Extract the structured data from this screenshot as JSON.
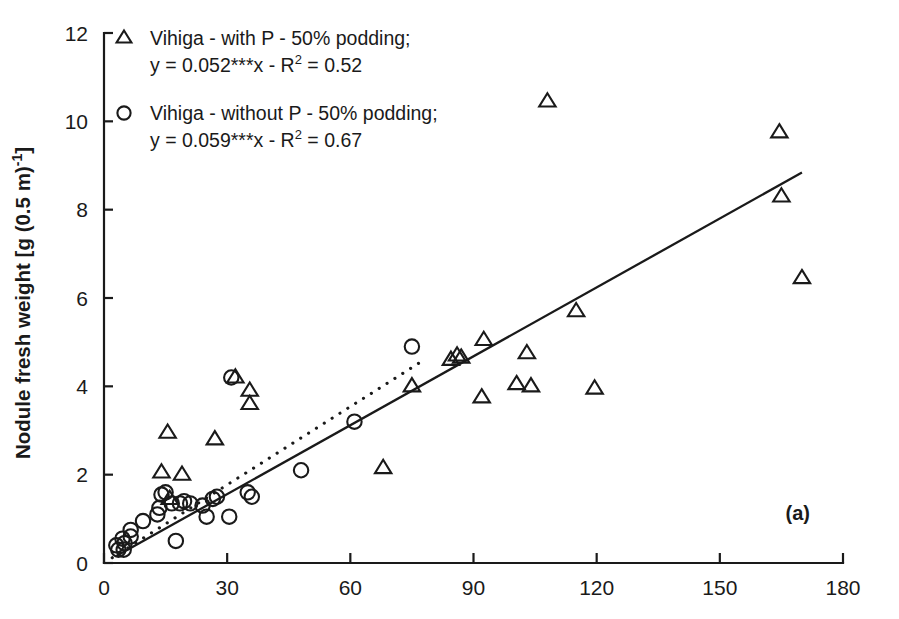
{
  "figure": {
    "panel_label": "(a)",
    "background": "#ffffff",
    "ink_color": "#1a1a1a"
  },
  "legend": {
    "entries": [
      {
        "marker": "triangle-up-open",
        "line1": "Vihiga - with P - 50% podding;",
        "eq_prefix": "y = 0.052***x - R",
        "eq_sup": "2",
        "eq_suffix": " = 0.52"
      },
      {
        "marker": "circle-open",
        "line1": "Vihiga - without P - 50% podding;",
        "eq_prefix": "y = 0.059***x - R",
        "eq_sup": "2",
        "eq_suffix": " = 0.67"
      }
    ]
  },
  "chart_data": {
    "type": "scatter",
    "title": "",
    "xlabel": "",
    "ylabel_parts": {
      "main": "Nodule fresh weight [g (0.5 m)",
      "sup": "-1",
      "tail": "]"
    },
    "ylabel": "Nodule fresh weight [g (0.5 m)-1]",
    "xlim": [
      0,
      180
    ],
    "ylim": [
      0,
      12
    ],
    "xticks": [
      0,
      30,
      60,
      90,
      120,
      150,
      180
    ],
    "yticks": [
      0,
      2,
      4,
      6,
      8,
      10,
      12
    ],
    "grid": false,
    "legend_position": "top-left",
    "series": [
      {
        "name": "Vihiga - with P - 50% podding",
        "marker": "triangle-up-open",
        "slope": 0.052,
        "r2": 0.52,
        "significance": "***",
        "fit_style": "solid",
        "fit_x": [
          3,
          170
        ],
        "points": [
          [
            14.0,
            2.05
          ],
          [
            16.0,
            1.45
          ],
          [
            19.0,
            2.0
          ],
          [
            15.5,
            2.95
          ],
          [
            27.0,
            2.8
          ],
          [
            35.5,
            3.9
          ],
          [
            35.5,
            3.6
          ],
          [
            32.0,
            4.2
          ],
          [
            68.0,
            2.15
          ],
          [
            75.0,
            4.0
          ],
          [
            84.5,
            4.6
          ],
          [
            86.0,
            4.7
          ],
          [
            87.0,
            4.65
          ],
          [
            92.5,
            5.05
          ],
          [
            92.0,
            3.75
          ],
          [
            100.5,
            4.05
          ],
          [
            103.0,
            4.75
          ],
          [
            104.0,
            4.0
          ],
          [
            108.0,
            10.45
          ],
          [
            115.0,
            5.7
          ],
          [
            119.5,
            3.95
          ],
          [
            164.5,
            9.75
          ],
          [
            165.0,
            8.3
          ],
          [
            170.0,
            6.45
          ]
        ]
      },
      {
        "name": "Vihiga - without P - 50% podding",
        "marker": "circle-open",
        "slope": 0.059,
        "r2": 0.67,
        "significance": "***",
        "fit_style": "dotted",
        "fit_x": [
          2,
          77
        ],
        "points": [
          [
            3.0,
            0.4
          ],
          [
            3.5,
            0.3
          ],
          [
            4.5,
            0.55
          ],
          [
            5.0,
            0.45
          ],
          [
            4.8,
            0.3
          ],
          [
            6.5,
            0.75
          ],
          [
            6.5,
            0.6
          ],
          [
            9.5,
            0.95
          ],
          [
            13.0,
            1.1
          ],
          [
            13.5,
            1.25
          ],
          [
            14.0,
            1.55
          ],
          [
            15.0,
            1.6
          ],
          [
            16.5,
            1.35
          ],
          [
            18.5,
            1.35
          ],
          [
            19.5,
            1.4
          ],
          [
            21.0,
            1.35
          ],
          [
            17.5,
            0.5
          ],
          [
            24.0,
            1.3
          ],
          [
            25.0,
            1.05
          ],
          [
            26.5,
            1.45
          ],
          [
            27.5,
            1.5
          ],
          [
            31.0,
            4.2
          ],
          [
            30.5,
            1.05
          ],
          [
            35.0,
            1.6
          ],
          [
            36.0,
            1.5
          ],
          [
            48.0,
            2.1
          ],
          [
            61.0,
            3.2
          ],
          [
            75.0,
            4.9
          ]
        ]
      }
    ]
  }
}
